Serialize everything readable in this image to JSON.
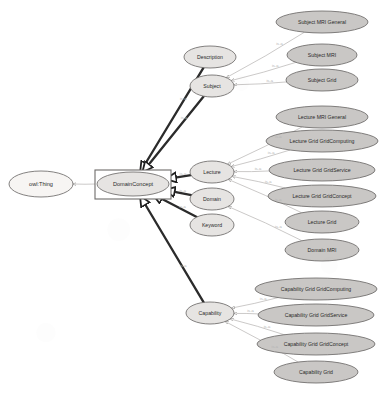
{
  "diagram": {
    "type": "class-hierarchy",
    "style": {
      "background": "#ffffff",
      "root_fill": "#f7f5f3",
      "mid_fill": "#e6e4e2",
      "leaf_fill": "#c9c7c5",
      "box_fill": "#ffffff",
      "stroke": "#6e6c6a",
      "edge_strong": "#2b2b2b",
      "edge_faint": "#b9b7b5",
      "label_color": "#2a2a2a",
      "edge_label_color": "#b4b4b4"
    },
    "edge_label": "is-a",
    "nodes": [
      {
        "id": "owlthing",
        "label": "owl:Thing",
        "kind": "root",
        "cx": 41,
        "cy": 184,
        "rx": 32,
        "ry": 13,
        "fs": 5.6
      },
      {
        "id": "domcon",
        "label": "DomainConcept",
        "kind": "boxed",
        "cx": 133,
        "cy": 184,
        "rx": 36,
        "ry": 12,
        "fs": 5.6
      },
      {
        "id": "descr",
        "label": "Description",
        "kind": "mid",
        "cx": 210,
        "cy": 57,
        "rx": 26,
        "ry": 11,
        "fs": 5.2
      },
      {
        "id": "subject",
        "label": "Subject",
        "kind": "mid",
        "cx": 212,
        "cy": 86,
        "rx": 22,
        "ry": 11,
        "fs": 5.2
      },
      {
        "id": "lecture",
        "label": "Lecture",
        "kind": "mid",
        "cx": 212,
        "cy": 172,
        "rx": 22,
        "ry": 11,
        "fs": 5.2
      },
      {
        "id": "domain",
        "label": "Domain",
        "kind": "mid",
        "cx": 212,
        "cy": 199,
        "rx": 22,
        "ry": 11,
        "fs": 5.2
      },
      {
        "id": "keyword",
        "label": "Keyword",
        "kind": "mid",
        "cx": 212,
        "cy": 225,
        "rx": 22,
        "ry": 11,
        "fs": 5.2
      },
      {
        "id": "capability",
        "label": "Capability",
        "kind": "mid",
        "cx": 210,
        "cy": 313,
        "rx": 24,
        "ry": 11,
        "fs": 5.2
      },
      {
        "id": "subjmrigen",
        "label": "Subject MRI General",
        "kind": "leaf",
        "cx": 322,
        "cy": 22,
        "rx": 46,
        "ry": 11,
        "fs": 5.2
      },
      {
        "id": "subjmri",
        "label": "Subject MRI",
        "kind": "leaf",
        "cx": 322,
        "cy": 55,
        "rx": 35,
        "ry": 11,
        "fs": 5.2
      },
      {
        "id": "subjgrid",
        "label": "Subject Grid",
        "kind": "leaf",
        "cx": 322,
        "cy": 80,
        "rx": 36,
        "ry": 11,
        "fs": 5.2
      },
      {
        "id": "lecmrigen",
        "label": "Lecture MRI General",
        "kind": "leaf",
        "cx": 322,
        "cy": 117,
        "rx": 46,
        "ry": 11,
        "fs": 5.2
      },
      {
        "id": "lecgridgc",
        "label": "Lecture Grid GridComputing",
        "kind": "leaf",
        "cx": 322,
        "cy": 141,
        "rx": 56,
        "ry": 11,
        "fs": 5.2
      },
      {
        "id": "lecgridgs",
        "label": "Lecture Grid GridService",
        "kind": "leaf",
        "cx": 322,
        "cy": 170,
        "rx": 53,
        "ry": 11,
        "fs": 5.2
      },
      {
        "id": "lecgridgco",
        "label": "Lecture Grid GridConcept",
        "kind": "leaf",
        "cx": 322,
        "cy": 196,
        "rx": 54,
        "ry": 11,
        "fs": 5.2
      },
      {
        "id": "lecgrid",
        "label": "Lecture Grid",
        "kind": "leaf",
        "cx": 322,
        "cy": 222,
        "rx": 37,
        "ry": 11,
        "fs": 5.2
      },
      {
        "id": "dommri",
        "label": "Domain MRI",
        "kind": "leaf",
        "cx": 322,
        "cy": 250,
        "rx": 37,
        "ry": 11,
        "fs": 5.2
      },
      {
        "id": "capgridgc",
        "label": "Capability Grid GridComputing",
        "kind": "leaf",
        "cx": 316,
        "cy": 289,
        "rx": 61,
        "ry": 11,
        "fs": 5.2
      },
      {
        "id": "capgridgs",
        "label": "Capability Grid GridService",
        "kind": "leaf",
        "cx": 316,
        "cy": 315,
        "rx": 58,
        "ry": 11,
        "fs": 5.2
      },
      {
        "id": "capgridgco",
        "label": "Capability Grid GridConcept",
        "kind": "leaf",
        "cx": 316,
        "cy": 344,
        "rx": 59,
        "ry": 11,
        "fs": 5.2
      },
      {
        "id": "capgrid",
        "label": "Capability Grid",
        "kind": "leaf",
        "cx": 316,
        "cy": 372,
        "rx": 42,
        "ry": 11,
        "fs": 5.2
      }
    ],
    "edges": [
      {
        "from": "domcon",
        "to": "owlthing",
        "weight": "thin",
        "label": ""
      },
      {
        "from": "descr",
        "to": "domcon",
        "weight": "thick",
        "label": "is-a"
      },
      {
        "from": "subject",
        "to": "domcon",
        "weight": "thick",
        "label": "is-a"
      },
      {
        "from": "lecture",
        "to": "domcon",
        "weight": "thick",
        "label": "is-a"
      },
      {
        "from": "domain",
        "to": "domcon",
        "weight": "thick",
        "label": "is-a"
      },
      {
        "from": "keyword",
        "to": "domcon",
        "weight": "thick",
        "label": "is-a"
      },
      {
        "from": "capability",
        "to": "domcon",
        "weight": "thick",
        "label": "is-a"
      },
      {
        "from": "subjmrigen",
        "to": "subject",
        "weight": "thin",
        "label": "is-a"
      },
      {
        "from": "subjmri",
        "to": "subject",
        "weight": "thin",
        "label": "is-a"
      },
      {
        "from": "subjgrid",
        "to": "subject",
        "weight": "thin",
        "label": "is-a"
      },
      {
        "from": "lecmrigen",
        "to": "lecture",
        "weight": "thin",
        "label": "is-a"
      },
      {
        "from": "lecgridgc",
        "to": "lecture",
        "weight": "thin",
        "label": "is-a"
      },
      {
        "from": "lecgridgs",
        "to": "lecture",
        "weight": "thin",
        "label": "is-a"
      },
      {
        "from": "lecgridgco",
        "to": "lecture",
        "weight": "thin",
        "label": "is-a"
      },
      {
        "from": "lecgrid",
        "to": "lecture",
        "weight": "thin",
        "label": "is-a"
      },
      {
        "from": "dommri",
        "to": "domain",
        "weight": "thin",
        "label": "is-a"
      },
      {
        "from": "capgridgc",
        "to": "capability",
        "weight": "thin",
        "label": "is-a"
      },
      {
        "from": "capgridgs",
        "to": "capability",
        "weight": "thin",
        "label": "is-a"
      },
      {
        "from": "capgridgco",
        "to": "capability",
        "weight": "thin",
        "label": "is-a"
      },
      {
        "from": "capgrid",
        "to": "capability",
        "weight": "thin",
        "label": "is-a"
      }
    ],
    "box": {
      "x": 95,
      "y": 170,
      "width": 76,
      "height": 29
    }
  }
}
